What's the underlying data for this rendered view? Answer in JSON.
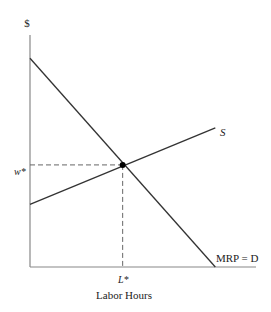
{
  "chart_data": {
    "type": "line",
    "title": "",
    "ylabel": "$",
    "xlabel": "Labor Hours",
    "series": [
      {
        "name": "S",
        "label": "S",
        "points": [
          [
            0,
            0.27
          ],
          [
            0.82,
            0.6
          ]
        ]
      },
      {
        "name": "MRP = D",
        "label": "MRP = D",
        "points": [
          [
            0,
            0.9
          ],
          [
            0.82,
            0
          ]
        ]
      }
    ],
    "equilibrium": {
      "x_label": "L*",
      "y_label": "w*",
      "x": 0.41,
      "y": 0.44
    },
    "xlim": [
      0,
      1
    ],
    "ylim": [
      0,
      1
    ],
    "grid": false,
    "colors": {
      "line": "#333333",
      "axis": "#777777",
      "dash": "#666666"
    }
  }
}
